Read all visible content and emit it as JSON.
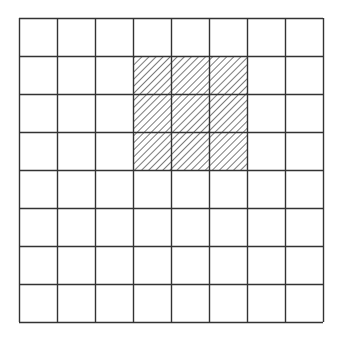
{
  "diagram": {
    "type": "grid",
    "rows": 8,
    "cols": 8,
    "origin": {
      "x": 19,
      "y": 18
    },
    "cell_size": 38,
    "line_color": "#333333",
    "background": "#ffffff",
    "hatch": {
      "color": "#333333",
      "spacing": 5,
      "direction": "diagonal-up-right"
    },
    "shaded_region": {
      "row_start": 1,
      "row_end": 3,
      "col_start": 3,
      "col_end": 5,
      "pattern": "diagonal-hatch"
    }
  }
}
